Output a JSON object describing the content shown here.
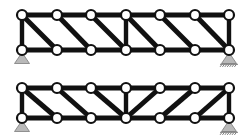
{
  "figure": {
    "background_color": "#ffffff",
    "member_color": "#111111",
    "node_fill_color": "#ffffff",
    "node_stroke_color": "#111111",
    "support_fill_color": "#b9b9b9",
    "support_stroke_color": "#6e6e6e",
    "width": 250,
    "height": 139
  },
  "chart_data": {
    "type": "diagram",
    "xlabel": "",
    "ylabel": "",
    "trusses": [
      {
        "id": "upper-truss",
        "name": "Upper truss",
        "panels": 6,
        "span": 207,
        "depth": 35,
        "top_chord_y": 15,
        "bottom_chord_y": 50,
        "node_x": [
          22,
          57,
          91,
          126,
          160,
          195,
          229
        ],
        "node_radius": 5.0,
        "chord_width": 5.0,
        "diagonal_width": 5.0,
        "vertical_width": 4.4,
        "top_nodes": [
          "T0",
          "T1",
          "T2",
          "T3",
          "T4",
          "T5",
          "T6"
        ],
        "bottom_nodes": [
          "B0",
          "B1",
          "B2",
          "B3",
          "B4",
          "B5",
          "B6"
        ],
        "top_chord_members": [
          [
            "T0",
            "T1"
          ],
          [
            "T1",
            "T2"
          ],
          [
            "T2",
            "T3"
          ],
          [
            "T3",
            "T4"
          ],
          [
            "T4",
            "T5"
          ],
          [
            "T5",
            "T6"
          ]
        ],
        "bottom_chord_members": [
          [
            "B0",
            "B1"
          ],
          [
            "B1",
            "B2"
          ],
          [
            "B2",
            "B3"
          ],
          [
            "B3",
            "B4"
          ],
          [
            "B4",
            "B5"
          ],
          [
            "B5",
            "B6"
          ]
        ],
        "vertical_members": [
          [
            "T0",
            "B0"
          ],
          [
            "T3",
            "B3"
          ],
          [
            "T6",
            "B6"
          ]
        ],
        "diagonal_members": [
          [
            "T0",
            "B1"
          ],
          [
            "T1",
            "B2"
          ],
          [
            "T2",
            "B3"
          ],
          [
            "T3",
            "B4"
          ],
          [
            "T4",
            "B5"
          ],
          [
            "T5",
            "B6"
          ]
        ],
        "diagonal_pattern": "all-descending",
        "supports": [
          {
            "id": "upper-left-support",
            "type": "pin",
            "node": "B0",
            "x": 22,
            "y": 50,
            "hatched": false
          },
          {
            "id": "upper-right-support",
            "type": "roller",
            "node": "B6",
            "x": 229,
            "y": 50,
            "hatched": true
          }
        ]
      },
      {
        "id": "lower-truss",
        "name": "Lower truss",
        "panels": 6,
        "span": 207,
        "depth": 30,
        "top_chord_y": 88,
        "bottom_chord_y": 118,
        "node_x": [
          22,
          57,
          91,
          126,
          160,
          195,
          229
        ],
        "node_radius": 5.0,
        "chord_width": 5.0,
        "diagonal_width": 5.0,
        "vertical_width": 4.4,
        "top_nodes": [
          "T0",
          "T1",
          "T2",
          "T3",
          "T4",
          "T5",
          "T6"
        ],
        "bottom_nodes": [
          "B0",
          "B1",
          "B2",
          "B3",
          "B4",
          "B5",
          "B6"
        ],
        "top_chord_members": [
          [
            "T0",
            "T1"
          ],
          [
            "T1",
            "T2"
          ],
          [
            "T2",
            "T3"
          ],
          [
            "T3",
            "T4"
          ],
          [
            "T4",
            "T5"
          ],
          [
            "T5",
            "T6"
          ]
        ],
        "bottom_chord_members": [
          [
            "B0",
            "B1"
          ],
          [
            "B1",
            "B2"
          ],
          [
            "B2",
            "B3"
          ],
          [
            "B3",
            "B4"
          ],
          [
            "B4",
            "B5"
          ],
          [
            "B5",
            "B6"
          ]
        ],
        "vertical_members": [
          [
            "T0",
            "B0"
          ],
          [
            "T3",
            "B3"
          ],
          [
            "T6",
            "B6"
          ]
        ],
        "diagonal_members": [
          [
            "T0",
            "B1"
          ],
          [
            "T1",
            "B2"
          ],
          [
            "T2",
            "B3"
          ],
          [
            "T4",
            "B3"
          ],
          [
            "T5",
            "B4"
          ],
          [
            "T6",
            "B5"
          ]
        ],
        "diagonal_pattern": "mirrored-v",
        "supports": [
          {
            "id": "lower-left-support",
            "type": "pin",
            "node": "B0",
            "x": 22,
            "y": 118,
            "hatched": false
          },
          {
            "id": "lower-right-support",
            "type": "roller",
            "node": "B6",
            "x": 229,
            "y": 118,
            "hatched": true
          }
        ]
      }
    ]
  }
}
